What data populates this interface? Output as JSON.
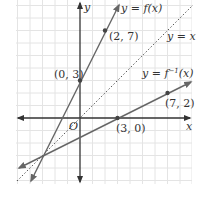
{
  "diagram": {
    "type": "coordinate-graph",
    "grid": true,
    "axes": {
      "x_label": "x",
      "y_label": "y",
      "origin_label": "O"
    },
    "lines": [
      {
        "name": "f",
        "label": "y = f(x)",
        "slope": 2,
        "intercept": 3,
        "style": "solid",
        "color": "#666666"
      },
      {
        "name": "identity",
        "label": "y = x",
        "slope": 1,
        "intercept": 0,
        "style": "dotted",
        "color": "#555555"
      },
      {
        "name": "f_inverse",
        "label": "y = f⁻¹(x)",
        "slope": 0.5,
        "intercept": -1.5,
        "style": "solid",
        "color": "#666666"
      }
    ],
    "points": [
      {
        "label": "(2, 7)",
        "x": 2,
        "y": 7
      },
      {
        "label": "(0, 3)",
        "x": 0,
        "y": 3
      },
      {
        "label": "(3, 0)",
        "x": 3,
        "y": 0
      },
      {
        "label": "(7, 2)",
        "x": 7,
        "y": 2
      }
    ],
    "text": {
      "f_label": "y = f(x)",
      "identity_label": "y = x",
      "inverse_label_main": "y = f",
      "inverse_sup": "−1",
      "inverse_label_tail": "(x)",
      "p27": "(2, 7)",
      "p03": "(0, 3)",
      "p30": "(3, 0)",
      "p72": "(7, 2)",
      "origin": "O",
      "x_axis": "x",
      "y_axis": "y"
    }
  }
}
